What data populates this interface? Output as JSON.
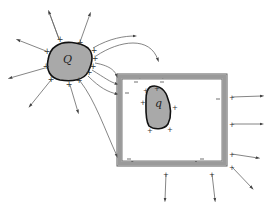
{
  "diagram": {
    "type": "electrostatics-field-lines",
    "colors": {
      "background": "#ffffff",
      "conductor_fill": "#a9a9a9",
      "conductor_stroke": "#1a1a1a",
      "box_wall": "#8c8c8c",
      "box_wall_edge": "#5a5a5a",
      "field_line": "#555555",
      "sign": "#333333"
    },
    "charges": [
      {
        "id": "Q",
        "label": "Q",
        "x": 67,
        "y": 60
      },
      {
        "id": "q",
        "label": "q",
        "x": 157,
        "y": 104
      }
    ],
    "box": {
      "x": 117,
      "y": 74,
      "width": 110,
      "height": 92,
      "wall": 4
    },
    "surface_signs": {
      "Q_plus": 12,
      "q_plus": 6,
      "box_inner_minus": 6,
      "box_outer_plus": 8
    }
  }
}
